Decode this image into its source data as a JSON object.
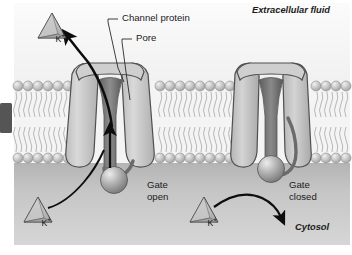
{
  "figure": {
    "regions": {
      "extracellular_label": "Extracellular fluid",
      "cytosol_label": "Cytosol"
    },
    "callouts": [
      {
        "name": "channel-protein",
        "text": "Channel protein"
      },
      {
        "name": "pore",
        "text": "Pore"
      }
    ],
    "channels": [
      {
        "name": "left-channel",
        "state_label_line1": "Gate",
        "state_label_line2": "open",
        "state": "open"
      },
      {
        "name": "right-channel",
        "state_label_line1": "Gate",
        "state_label_line2": "closed",
        "state": "closed"
      }
    ],
    "ions": [
      {
        "name": "potassium-ion-extracellular",
        "symbol": "K",
        "charge": "+"
      },
      {
        "name": "potassium-ion-cytosol-left",
        "symbol": "K",
        "charge": "+"
      },
      {
        "name": "potassium-ion-cytosol-right",
        "symbol": "K",
        "charge": "+"
      }
    ],
    "arrows": [
      {
        "name": "ion-flow-arrow-open-channel",
        "direction": "upward-through-pore"
      },
      {
        "name": "ion-exit-arrow",
        "direction": "up-left-to-extracellular"
      },
      {
        "name": "ion-blocked-arrow",
        "direction": "curving-right-down"
      }
    ],
    "colors": {
      "extracellular_bg": "#f6f6f6",
      "cytosol_bg": "#c9c9c9",
      "membrane_bg": "#f2f2f2",
      "lipid_head": "#b9b9b9",
      "lipid_head_highlight": "#e9e9e9",
      "lipid_tail": "#a8a8a8",
      "protein_fill": "#c2c2c2",
      "protein_edge": "#4a4a4a",
      "pore_dark": "#6e6e6e",
      "gate_ball": "#9a9a9a",
      "arrow": "#0d0d0d",
      "ion_fill": "#bdbdbd",
      "ion_edge": "#3a3a3a",
      "left_tab": "#555555",
      "text": "#1b1b1b"
    }
  }
}
